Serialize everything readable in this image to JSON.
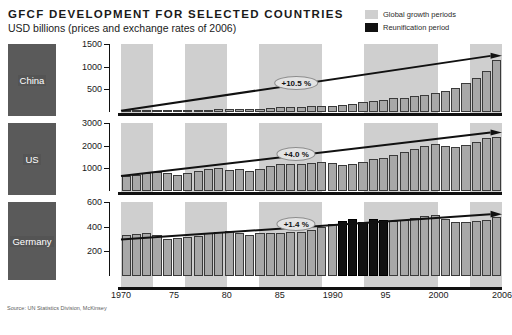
{
  "header": {
    "title": "GFCF DEVELOPMENT FOR SELECTED COUNTRIES",
    "subtitle": "USD billions (prices and exchange rates of 2006)"
  },
  "legend": {
    "position": "top-right",
    "items": [
      {
        "label": "Global growth periods",
        "color": "#cfcfcf",
        "icon": "square-swatch-icon"
      },
      {
        "label": "Reunification period",
        "color": "#111111",
        "icon": "square-swatch-icon"
      }
    ]
  },
  "source": "Source: UN Statistics Division, McKinsey",
  "caption": "",
  "xaxis": {
    "ticks": [
      "1970",
      "75",
      "80",
      "85",
      "1990",
      "95",
      "2000",
      "2006"
    ],
    "tick_years": [
      1970,
      1975,
      1980,
      1985,
      1990,
      1995,
      2000,
      2006
    ],
    "range": [
      1970,
      2006
    ]
  },
  "growth_bands": [
    {
      "start": 1970,
      "end": 1973
    },
    {
      "start": 1976,
      "end": 1980
    },
    {
      "start": 1983,
      "end": 1989
    },
    {
      "start": 1993,
      "end": 2000
    },
    {
      "start": 2003,
      "end": 2006
    }
  ],
  "reunification_band": {
    "start": 1990,
    "end": 1995
  },
  "chart_data": [
    {
      "type": "bar",
      "title": "GFCF DEVELOPMENT FOR SELECTED COUNTRIES",
      "subtitle": "USD billions (prices and exchange rates of 2006)",
      "panel": "China",
      "xlabel": "",
      "ylabel": "USD billions",
      "ylim": [
        0,
        1500
      ],
      "yticks": [
        500,
        1000,
        1500
      ],
      "grid": false,
      "annotation": "+10.5 %",
      "cagr_percent": 10.5,
      "x": [
        1970,
        1971,
        1972,
        1973,
        1974,
        1975,
        1976,
        1977,
        1978,
        1979,
        1980,
        1981,
        1982,
        1983,
        1984,
        1985,
        1986,
        1987,
        1988,
        1989,
        1990,
        1991,
        1992,
        1993,
        1994,
        1995,
        1996,
        1997,
        1998,
        1999,
        2000,
        2001,
        2002,
        2003,
        2004,
        2005,
        2006
      ],
      "values": [
        30,
        32,
        34,
        38,
        40,
        44,
        44,
        48,
        55,
        58,
        60,
        60,
        66,
        74,
        86,
        100,
        108,
        118,
        130,
        128,
        130,
        150,
        180,
        220,
        250,
        275,
        300,
        320,
        345,
        375,
        410,
        460,
        530,
        650,
        760,
        900,
        1150
      ]
    },
    {
      "type": "bar",
      "panel": "US",
      "xlabel": "",
      "ylabel": "USD billions",
      "ylim": [
        0,
        3000
      ],
      "yticks": [
        1000,
        2000,
        3000
      ],
      "grid": false,
      "annotation": "+4.0 %",
      "cagr_percent": 4.0,
      "x": [
        1970,
        1971,
        1972,
        1973,
        1974,
        1975,
        1976,
        1977,
        1978,
        1979,
        1980,
        1981,
        1982,
        1983,
        1984,
        1985,
        1986,
        1987,
        1988,
        1989,
        1990,
        1991,
        1992,
        1993,
        1994,
        1995,
        1996,
        1997,
        1998,
        1999,
        2000,
        2001,
        2002,
        2003,
        2004,
        2005,
        2006
      ],
      "values": [
        660,
        700,
        780,
        840,
        790,
        720,
        790,
        880,
        960,
        1000,
        940,
        960,
        900,
        960,
        1120,
        1180,
        1200,
        1210,
        1250,
        1260,
        1220,
        1130,
        1190,
        1290,
        1400,
        1450,
        1580,
        1700,
        1840,
        1970,
        2080,
        1990,
        1960,
        2040,
        2180,
        2320,
        2400
      ]
    },
    {
      "type": "bar",
      "panel": "Germany",
      "xlabel": "",
      "ylabel": "USD billions",
      "ylim": [
        0,
        600
      ],
      "yticks": [
        200,
        400,
        600
      ],
      "grid": false,
      "annotation": "+1.4 %",
      "cagr_percent": 1.4,
      "x": [
        1970,
        1971,
        1972,
        1973,
        1974,
        1975,
        1976,
        1977,
        1978,
        1979,
        1980,
        1981,
        1982,
        1983,
        1984,
        1985,
        1986,
        1987,
        1988,
        1989,
        1990,
        1991,
        1992,
        1993,
        1994,
        1995,
        1996,
        1997,
        1998,
        1999,
        2000,
        2001,
        2002,
        2003,
        2004,
        2005,
        2006
      ],
      "values": [
        330,
        340,
        345,
        335,
        300,
        305,
        315,
        325,
        345,
        360,
        365,
        345,
        330,
        345,
        345,
        345,
        355,
        360,
        375,
        395,
        420,
        450,
        465,
        440,
        465,
        455,
        450,
        455,
        470,
        485,
        495,
        465,
        440,
        440,
        445,
        455,
        480
      ],
      "highlight_years": [
        1991,
        1992,
        1993,
        1994,
        1995
      ],
      "highlight_color": "#111111"
    }
  ]
}
